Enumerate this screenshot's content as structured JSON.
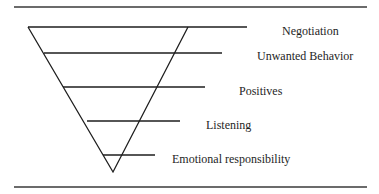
{
  "diagram": {
    "type": "inverted-pyramid",
    "levels": [
      {
        "label": "Negotiation",
        "line_y": 27,
        "line_x1": 28,
        "line_x2": 247,
        "label_x": 282,
        "label_y": 25
      },
      {
        "label": "Unwanted Behavior",
        "line_y": 53,
        "line_x1": 44,
        "line_x2": 222,
        "label_x": 257,
        "label_y": 50
      },
      {
        "label": "Positives",
        "line_y": 87,
        "line_x1": 63,
        "line_x2": 205,
        "label_x": 239,
        "label_y": 85
      },
      {
        "label": "Listening",
        "line_y": 121,
        "line_x1": 87,
        "line_x2": 180,
        "label_x": 206,
        "label_y": 119
      },
      {
        "label": "Emotional responsibility",
        "line_y": 155,
        "line_x1": 103,
        "line_x2": 155,
        "label_x": 172,
        "label_y": 153
      }
    ],
    "triangle": {
      "top_left": [
        28,
        27
      ],
      "top_right": [
        188,
        27
      ],
      "bottom": [
        113,
        172
      ]
    },
    "rules": {
      "top_y": 7,
      "bottom_y": 187,
      "x1": 14,
      "x2": 367
    },
    "colors": {
      "line": "#1e1e1e",
      "rule": "#3a3a3a",
      "background": "#ffffff"
    }
  }
}
